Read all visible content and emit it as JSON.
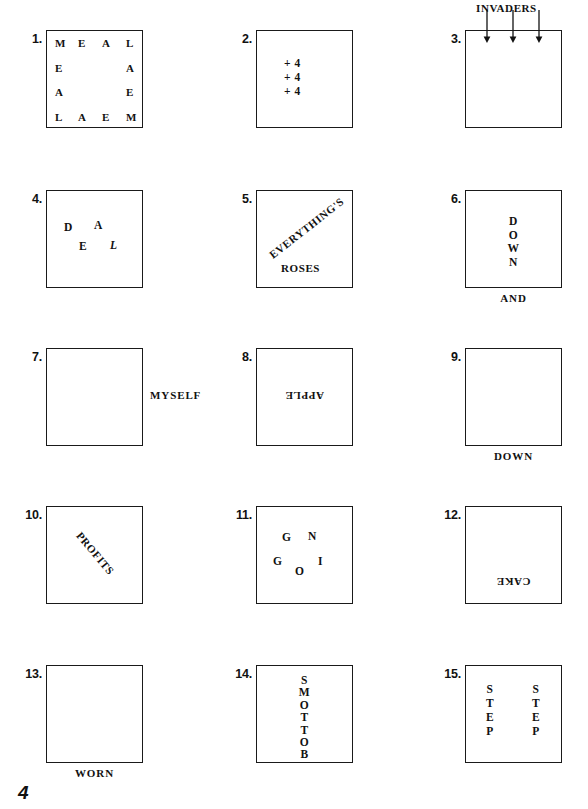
{
  "page": {
    "page_number": "4",
    "background_color": "#ffffff",
    "ink_color": "#111111"
  },
  "puzzles": [
    {
      "number": "1.",
      "kind": "perimeter-word",
      "word": "MEAL",
      "top_letters": [
        "M",
        "E",
        "A",
        "L"
      ],
      "right_letters": [
        "A",
        "E"
      ],
      "bottom_letters": [
        "L",
        "A",
        "E",
        "M"
      ],
      "left_letters": [
        "E",
        "A"
      ]
    },
    {
      "number": "2.",
      "kind": "stacked-text",
      "lines": [
        "+ 4",
        "+ 4",
        "+ 4"
      ]
    },
    {
      "number": "3.",
      "kind": "label-above-with-arrows",
      "label": "INVADERS",
      "arrow_count": 3,
      "arrow_direction": "down"
    },
    {
      "number": "4.",
      "kind": "scattered-letters",
      "letters": [
        {
          "char": "D",
          "x": 18,
          "y": 32,
          "italic": false
        },
        {
          "char": "A",
          "x": 48,
          "y": 30,
          "italic": false
        },
        {
          "char": "E",
          "x": 33,
          "y": 51,
          "italic": false
        },
        {
          "char": "L",
          "x": 64,
          "y": 50,
          "italic": true
        }
      ],
      "solution_word": "DEAL"
    },
    {
      "number": "5.",
      "kind": "diagonal-and-word",
      "diagonal_text": "EVERYTHING'S",
      "diagonal_direction": "up",
      "bottom_text": "ROSES"
    },
    {
      "number": "6.",
      "kind": "vertical-word-with-label-below",
      "vertical_letters": [
        "D",
        "O",
        "W",
        "N"
      ],
      "below_label": "AND"
    },
    {
      "number": "7.",
      "kind": "empty-box-label-right",
      "right_label": "MYSELF"
    },
    {
      "number": "8.",
      "kind": "upside-down-word",
      "text": "APPLE"
    },
    {
      "number": "9.",
      "kind": "empty-box-label-below",
      "below_label": "DOWN"
    },
    {
      "number": "10.",
      "kind": "diagonal-word",
      "text": "PROFITS",
      "diagonal_direction": "down"
    },
    {
      "number": "11.",
      "kind": "scattered-letters",
      "letters": [
        {
          "char": "G",
          "x": 26,
          "y": 26,
          "italic": false
        },
        {
          "char": "N",
          "x": 52,
          "y": 25,
          "italic": false
        },
        {
          "char": "G",
          "x": 17,
          "y": 50,
          "italic": false
        },
        {
          "char": "I",
          "x": 62,
          "y": 50,
          "italic": false
        },
        {
          "char": "O",
          "x": 39,
          "y": 60,
          "italic": false
        }
      ],
      "solution_word": "GOING"
    },
    {
      "number": "12.",
      "kind": "upside-down-word-low",
      "text": "CAKE"
    },
    {
      "number": "13.",
      "kind": "empty-box-label-below",
      "below_label": "WORN"
    },
    {
      "number": "14.",
      "kind": "vertical-word",
      "vertical_letters": [
        "S",
        "M",
        "O",
        "T",
        "T",
        "O",
        "B"
      ],
      "solution_word": "BOTTOMS"
    },
    {
      "number": "15.",
      "kind": "two-vertical-words",
      "left_letters": [
        "S",
        "T",
        "E",
        "P"
      ],
      "right_letters": [
        "S",
        "T",
        "E",
        "P"
      ]
    }
  ]
}
